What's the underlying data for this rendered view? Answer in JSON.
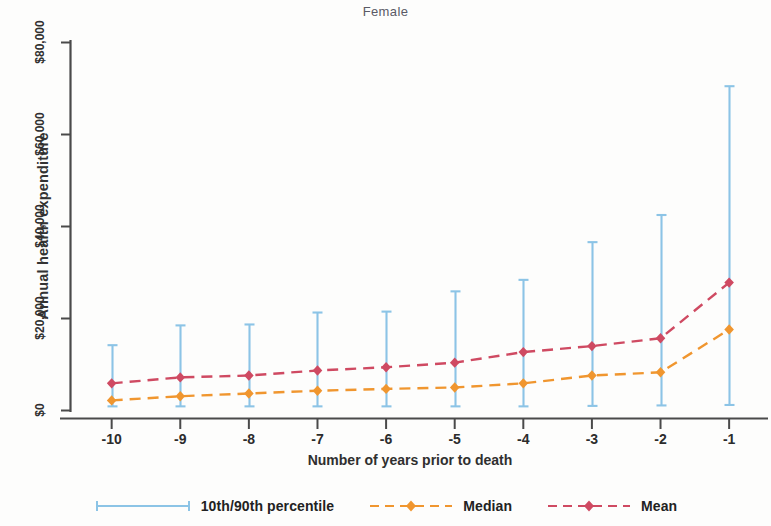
{
  "chart_data": {
    "type": "line",
    "title": "Female",
    "xlabel": "Number of years prior to death",
    "ylabel": "Annual health expenditure",
    "x": [
      -10,
      -9,
      -8,
      -7,
      -6,
      -5,
      -4,
      -3,
      -2,
      -1
    ],
    "xtick_labels": [
      "-10",
      "-9",
      "-8",
      "-7",
      "-6",
      "-5",
      "-4",
      "-3",
      "-2",
      "-1"
    ],
    "ytick_values": [
      0,
      20000,
      40000,
      60000,
      80000
    ],
    "ytick_labels": [
      "$0",
      "$20,000",
      "$40,000",
      "$60,000",
      "$80,000"
    ],
    "ylim": [
      0,
      88000
    ],
    "xlim": [
      -10.6,
      -0.55
    ],
    "grid": false,
    "legend_position": "bottom",
    "series": [
      {
        "name": "10th/90th percentile",
        "type": "errorbar",
        "color": "#8cc4e6",
        "lower": [
          900,
          900,
          900,
          900,
          900,
          900,
          900,
          1000,
          1100,
          1200
        ],
        "upper": [
          14200,
          18500,
          18700,
          21300,
          21500,
          25900,
          28400,
          36600,
          42500,
          70500
        ]
      },
      {
        "name": "Median",
        "type": "line",
        "color": "#f0962f",
        "dash": "dashed",
        "marker": "diamond",
        "values": [
          2200,
          3100,
          3700,
          4300,
          4700,
          5000,
          5900,
          7600,
          8300,
          17600
        ]
      },
      {
        "name": "Mean",
        "type": "line",
        "color": "#cf4a62",
        "dash": "dashed",
        "marker": "diamond",
        "values": [
          5900,
          7200,
          7600,
          8700,
          9400,
          10400,
          12700,
          14000,
          15700,
          27800
        ]
      }
    ]
  },
  "axes": {
    "title": "Female",
    "y_title": "Annual health expenditure",
    "x_title": "Number of years prior to death",
    "y_labels": [
      "$0",
      "$20,000",
      "$40,000",
      "$60,000",
      "$80,000"
    ],
    "x_labels": [
      "-10",
      "-9",
      "-8",
      "-7",
      "-6",
      "-5",
      "-4",
      "-3",
      "-2",
      "-1"
    ]
  },
  "legend": {
    "items": [
      {
        "label": "10th/90th percentile",
        "color": "#8cc4e6",
        "key": "capped-line"
      },
      {
        "label": "Median",
        "color": "#f0962f",
        "key": "dashed-diamond"
      },
      {
        "label": "Mean",
        "color": "#cf4a62",
        "key": "dashed-diamond"
      }
    ]
  },
  "colors": {
    "percentile": "#8cc4e6",
    "median": "#f0962f",
    "mean": "#cf4a62",
    "axis": "#4a4a4a",
    "background": "#fdfdfc"
  }
}
